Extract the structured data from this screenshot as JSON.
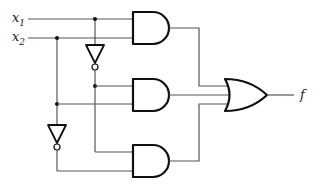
{
  "diagram": {
    "type": "logic-circuit",
    "inputs": [
      {
        "name": "x",
        "subscript": "1"
      },
      {
        "name": "x",
        "subscript": "2"
      }
    ],
    "output": {
      "name": "f"
    },
    "gates": [
      {
        "id": "not1",
        "type": "NOT",
        "input": "x1"
      },
      {
        "id": "not2",
        "type": "NOT",
        "input": "x2"
      },
      {
        "id": "and1",
        "type": "AND",
        "inputs": [
          "x1",
          "x2"
        ]
      },
      {
        "id": "and2",
        "type": "AND",
        "inputs": [
          "not x1",
          "x2"
        ]
      },
      {
        "id": "and3",
        "type": "AND",
        "inputs": [
          "not x1",
          "not x2"
        ]
      },
      {
        "id": "or1",
        "type": "OR",
        "inputs": [
          "and1",
          "and2",
          "and3"
        ],
        "output": "f"
      }
    ],
    "colors": {
      "wire": "#555555",
      "gate": "#111111",
      "background": "#ffffff"
    }
  }
}
